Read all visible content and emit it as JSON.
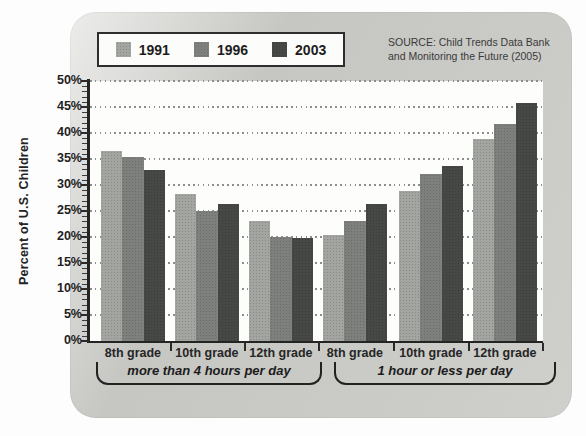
{
  "source": {
    "line1": "SOURCE: Child Trends Data Bank",
    "line2": "and Monitoring the Future (2005)"
  },
  "chart_data": {
    "type": "bar",
    "title": "",
    "xlabel": "",
    "ylabel": "Percent of U.S. Children",
    "ylim": [
      0,
      50
    ],
    "y_tick_step": 5,
    "y_tick_labels": [
      "50%",
      "45%",
      "40%",
      "35%",
      "30%",
      "25%",
      "20%",
      "15%",
      "10%",
      "5%",
      "0%"
    ],
    "grid": "dotted-horizontal",
    "legend_position": "top-left",
    "categories": [
      "8th grade",
      "10th grade",
      "12th grade",
      "8th grade",
      "10th grade",
      "12th grade"
    ],
    "groups": [
      {
        "label": "more than 4 hours per day",
        "category_indexes": [
          0,
          1,
          2
        ]
      },
      {
        "label": "1 hour or less per day",
        "category_indexes": [
          3,
          4,
          5
        ]
      }
    ],
    "series": [
      {
        "name": "1991",
        "color": "#a2a5a0",
        "values": [
          36.5,
          28.3,
          23.0,
          20.4,
          28.9,
          38.8
        ]
      },
      {
        "name": "1996",
        "color": "#7d807c",
        "values": [
          35.4,
          25.0,
          20.0,
          23.0,
          32.2,
          41.8
        ]
      },
      {
        "name": "2003",
        "color": "#454845",
        "values": [
          32.8,
          26.3,
          19.8,
          26.3,
          33.6,
          45.8
        ]
      }
    ]
  }
}
